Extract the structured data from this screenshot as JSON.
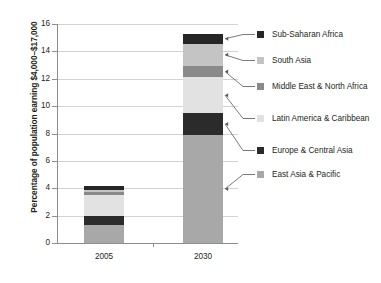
{
  "chart_data": {
    "type": "bar",
    "subtype": "stacked-bar",
    "title": "",
    "xlabel": "",
    "ylabel": "Percentage of population earning $4,000–$17,000",
    "categories": [
      "2005",
      "2030"
    ],
    "ylim": [
      0,
      16
    ],
    "ytick_labels": [
      "0",
      "2",
      "4",
      "6",
      "8",
      "10",
      "12",
      "14",
      "16"
    ],
    "ytick_values": [
      0,
      2,
      4,
      6,
      8,
      10,
      12,
      14,
      16
    ],
    "grid": true,
    "legend_position": "right",
    "stack_order_bottom_to_top": [
      "East Asia & Pacific",
      "Europe & Central Asia",
      "Latin America & Caribbean",
      "Middle East & North Africa",
      "South Asia",
      "Sub-Saharan Africa"
    ],
    "series": [
      {
        "name": "East Asia & Pacific",
        "color": "#a8a8a8",
        "values": [
          1.35,
          7.9
        ]
      },
      {
        "name": "Europe & Central Asia",
        "color": "#2b2b2b",
        "values": [
          0.62,
          1.6
        ]
      },
      {
        "name": "Latin America & Caribbean",
        "color": "#e2e2e2",
        "values": [
          1.55,
          2.6
        ]
      },
      {
        "name": "Middle East & North Africa",
        "color": "#8a8a8a",
        "values": [
          0.2,
          0.85
        ]
      },
      {
        "name": "South Asia",
        "color": "#c4c4c4",
        "values": [
          0.15,
          1.6
        ]
      },
      {
        "name": "Sub-Saharan Africa",
        "color": "#262626",
        "values": [
          0.33,
          0.75
        ]
      }
    ],
    "totals": [
      4.2,
      15.3
    ]
  },
  "axis": {
    "y_title": "Percentage of population earning $4,000–$17,000",
    "ticks": [
      {
        "label": "16",
        "value": 16
      },
      {
        "label": "14",
        "value": 14
      },
      {
        "label": "12",
        "value": 12
      },
      {
        "label": "10",
        "value": 10
      },
      {
        "label": "8",
        "value": 8
      },
      {
        "label": "6",
        "value": 6
      },
      {
        "label": "4",
        "value": 4
      },
      {
        "label": "2",
        "value": 2
      },
      {
        "label": "0",
        "value": 0
      }
    ],
    "x_categories": [
      {
        "label": "2005"
      },
      {
        "label": "2030"
      }
    ]
  },
  "legend": {
    "items": [
      {
        "label": "Sub-Saharan Africa",
        "color": "#262626"
      },
      {
        "label": "South Asia",
        "color": "#c4c4c4"
      },
      {
        "label": "Middle East & North Africa",
        "color": "#8a8a8a"
      },
      {
        "label": "Latin America & Caribbean",
        "color": "#e2e2e2"
      },
      {
        "label": "Europe & Central Asia",
        "color": "#2b2b2b"
      },
      {
        "label": "East Asia & Pacific",
        "color": "#a8a8a8"
      }
    ]
  }
}
